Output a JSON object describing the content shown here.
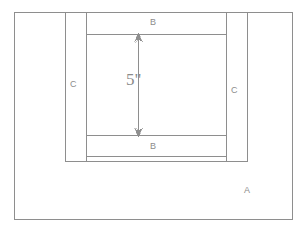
{
  "drawing": {
    "title": "Mat / frame opening layout diagram",
    "background_color": "#ffffff",
    "line_color": "#8e8e8e",
    "text_color": "#8c8c8c",
    "labels": {
      "top_band": "B",
      "bottom_band": "B",
      "left_band": "C",
      "right_band": "C",
      "outer_area": "A",
      "dimension": "5\""
    },
    "dimension_value": "5",
    "dimension_unit": "\"",
    "geometry": {
      "outer_rect": {
        "x": 14,
        "y": 12,
        "width": 279,
        "height": 208
      },
      "band_rect": {
        "x": 65,
        "y": 12,
        "width": 183,
        "height": 150
      },
      "opening_rect": {
        "x": 86,
        "y": 34,
        "width": 141,
        "height": 102
      },
      "dimension_arrow": {
        "x": 138,
        "y_top": 34,
        "y_bottom": 136
      }
    }
  }
}
